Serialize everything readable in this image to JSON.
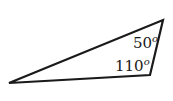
{
  "diagram": {
    "type": "triangle",
    "stroke_color": "#1a1a1a",
    "background": "#ffffff",
    "vertices": {
      "left": [
        9,
        83
      ],
      "top_right": [
        163,
        20
      ],
      "bottom_right": [
        150,
        75
      ]
    },
    "angles": [
      {
        "vertex": "top_right",
        "value": "50",
        "unit": "o"
      },
      {
        "vertex": "bottom_right",
        "value": "110",
        "unit": "o"
      }
    ]
  }
}
